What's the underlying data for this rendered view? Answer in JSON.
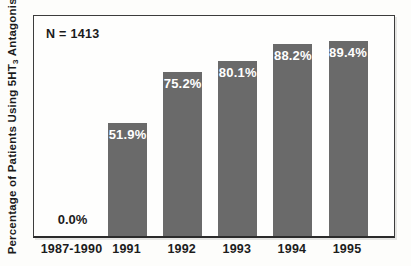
{
  "figure": {
    "annotation": "N = 1413",
    "ylabel_pre": "Percentage of Patients Using 5HT",
    "ylabel_sub": "3",
    "ylabel_post": " Antagonists"
  },
  "chart_data": {
    "type": "bar",
    "title": "",
    "xlabel": "",
    "ylabel": "Percentage of Patients Using 5HT3 Antagonists",
    "annotation": "N = 1413",
    "categories": [
      "1987-1990",
      "1991",
      "1992",
      "1993",
      "1994",
      "1995"
    ],
    "values": [
      0.0,
      51.9,
      75.2,
      80.1,
      88.2,
      89.4
    ],
    "value_labels": [
      "0.0%",
      "51.9%",
      "75.2%",
      "80.1%",
      "88.2%",
      "89.4%"
    ],
    "ylim": [
      0,
      102
    ],
    "grid": false,
    "legend": "none",
    "bar_color": "#6a6a6a",
    "bar_label_color": "#ffffff",
    "zero_label_color": "#1b1b1b",
    "frame_color": "#3c3c3c"
  }
}
